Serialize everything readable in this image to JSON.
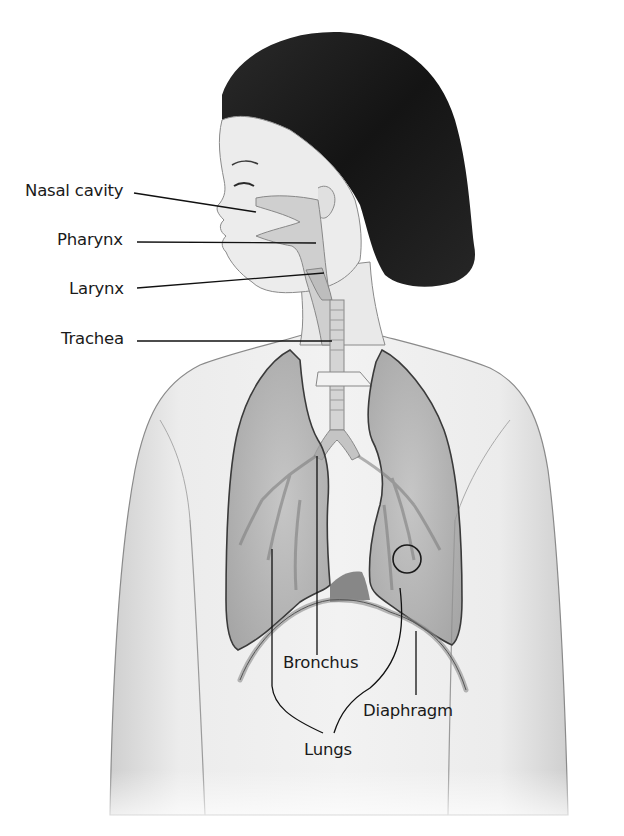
{
  "diagram": {
    "colors": {
      "background": "#ffffff",
      "skin": "#e6e6e6",
      "skin_outline": "#8a8a8a",
      "hair": "#1c1c1c",
      "lung_fill": "#9a9a9a",
      "airway_fill": "#c8c8c8",
      "leader_line": "#111111",
      "label_text": "#1a1a1a"
    },
    "labels": [
      {
        "id": "nasal-cavity",
        "text": "Nasal cavity",
        "x": 25,
        "y": 183
      },
      {
        "id": "pharynx",
        "text": "Pharynx",
        "x": 57,
        "y": 232
      },
      {
        "id": "larynx",
        "text": "Larynx",
        "x": 69,
        "y": 281
      },
      {
        "id": "trachea",
        "text": "Trachea",
        "x": 61,
        "y": 331
      },
      {
        "id": "bronchus",
        "text": "Bronchus",
        "x": 283,
        "y": 655
      },
      {
        "id": "diaphragm",
        "text": "Diaphragm",
        "x": 363,
        "y": 703
      },
      {
        "id": "lungs",
        "text": "Lungs",
        "x": 304,
        "y": 742
      }
    ]
  }
}
